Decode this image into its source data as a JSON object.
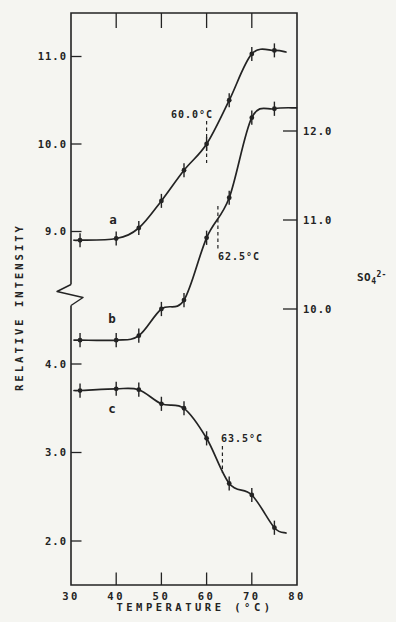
{
  "figure": {
    "background": "#f5f5f1",
    "ink": "#232323"
  },
  "chart_data": {
    "type": "line",
    "title": "",
    "xlabel": "TEMPERATURE (°C)",
    "ylabel": "RELATIVE INTENSITY",
    "right_label": {
      "base": "SO",
      "sub": "4",
      "sup": "2-"
    },
    "xlim": [
      30,
      80
    ],
    "x_ticks": [
      30,
      40,
      50,
      60,
      70,
      80
    ],
    "x_tick_labels": [
      "30",
      "40",
      "50",
      "60",
      "70",
      "80"
    ],
    "left_axis": {
      "upper_ticks": [
        11.0,
        10.0,
        9.0
      ],
      "upper_tick_labels": [
        "11.0",
        "10.0",
        "9.0"
      ],
      "lower_ticks": [
        4.0,
        3.0,
        2.0
      ],
      "lower_tick_labels": [
        "4.0",
        "3.0",
        "2.0"
      ],
      "axis_break": true
    },
    "right_axis": {
      "ticks": [
        12.0,
        11.0,
        10.0
      ],
      "tick_labels": [
        "12.0",
        "11.0",
        "10.0"
      ]
    },
    "x": [
      32,
      40,
      45,
      50,
      55,
      60,
      65,
      70,
      75
    ],
    "series": [
      {
        "name": "a",
        "scale": "left-upper",
        "values": [
          8.9,
          8.92,
          9.04,
          9.35,
          9.7,
          10.0,
          10.5,
          11.03,
          11.07
        ],
        "error": 0.08
      },
      {
        "name": "b",
        "scale": "right",
        "values": [
          9.65,
          9.65,
          9.7,
          10.0,
          10.1,
          10.8,
          11.25,
          12.15,
          12.25
        ],
        "error": 0.08
      },
      {
        "name": "c",
        "scale": "left-lower",
        "values": [
          3.7,
          3.72,
          3.71,
          3.55,
          3.5,
          3.16,
          2.65,
          2.52,
          2.15
        ],
        "error": 0.08
      }
    ],
    "curve_labels": [
      "a",
      "b",
      "c"
    ],
    "annotations": [
      {
        "text": "60.0°C",
        "temp": 60.0,
        "series": "a"
      },
      {
        "text": "62.5°C",
        "temp": 62.5,
        "series": "b"
      },
      {
        "text": "63.5°C",
        "temp": 63.5,
        "series": "c"
      }
    ]
  }
}
